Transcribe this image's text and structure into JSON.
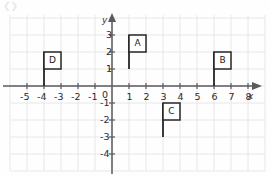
{
  "figure": {
    "background_color": "#fefefe",
    "grid_color": "#e2e2e6",
    "axis_color": "#5a5a5f",
    "shape_color": "#262626"
  },
  "axes": {
    "x_label": "x",
    "y_label": "y",
    "origin_label": "0",
    "x_ticks": [
      "-5",
      "-4",
      "-3",
      "-2",
      "-1",
      "1",
      "2",
      "3",
      "4",
      "5",
      "6",
      "7",
      "8"
    ],
    "y_ticks": [
      "3",
      "2",
      "1",
      "-1",
      "-2",
      "-3",
      "-4"
    ],
    "x_range": [
      -6,
      9
    ],
    "y_range": [
      -5,
      4
    ],
    "unit_px": 17,
    "grid": true
  },
  "chart_data": {
    "type": "scatter",
    "title": "",
    "xlabel": "x",
    "ylabel": "y",
    "xlim": [
      -6,
      9
    ],
    "ylim": [
      -5,
      4
    ],
    "grid": true,
    "x": [
      -5,
      -4,
      -3,
      -2,
      -1,
      1,
      2,
      3,
      4,
      5,
      6,
      7,
      8
    ],
    "series": [
      {
        "name": "flags",
        "shape": "flag",
        "items": [
          {
            "label": "A",
            "pole_x": 1,
            "pole_y_bottom": 1,
            "pole_y_top": 3,
            "box_x0": 1,
            "box_y0": 2,
            "box_x1": 2,
            "box_y1": 3
          },
          {
            "label": "B",
            "pole_x": 6,
            "pole_y_bottom": 0,
            "pole_y_top": 2,
            "box_x0": 6,
            "box_y0": 1,
            "box_x1": 7,
            "box_y1": 2
          },
          {
            "label": "C",
            "pole_x": 3,
            "pole_y_bottom": -3,
            "pole_y_top": -1,
            "box_x0": 3,
            "box_y0": -2,
            "box_x1": 4,
            "box_y1": -1
          },
          {
            "label": "D",
            "pole_x": -4,
            "pole_y_bottom": 0,
            "pole_y_top": 2,
            "box_x0": -4,
            "box_y0": 1,
            "box_x1": -3,
            "box_y1": 2
          }
        ]
      }
    ]
  }
}
